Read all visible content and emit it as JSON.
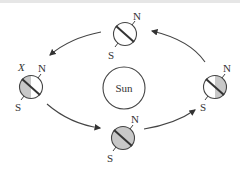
{
  "diagram": {
    "sun": {
      "label": "Sun"
    },
    "earths": [
      {
        "position": "top",
        "north_label": "N",
        "south_label": "S",
        "shading": "none"
      },
      {
        "position": "left",
        "north_label": "N",
        "south_label": "S",
        "marker_label": "X",
        "shading": "left-half"
      },
      {
        "position": "bottom",
        "north_label": "N",
        "south_label": "S",
        "shading": "full"
      },
      {
        "position": "right",
        "north_label": "N",
        "south_label": "S",
        "shading": "right-half"
      }
    ],
    "orbit_direction": "counterclockwise",
    "colors": {
      "stroke": "#444444",
      "shade": "#c8c8c8",
      "background": "#ffffff"
    }
  }
}
